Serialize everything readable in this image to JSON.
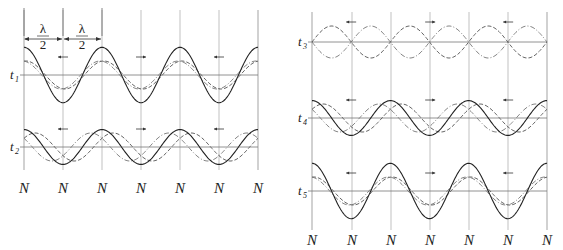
{
  "figure": {
    "wavelength_label": {
      "numerator": "λ",
      "denominator": "2"
    },
    "node_label": "N",
    "colors": {
      "line": "#333333",
      "grid": "#999999",
      "resultant": "#222222",
      "components": "#666666"
    }
  },
  "left_panel": {
    "node_x": [
      24,
      63,
      102,
      141,
      180,
      219,
      258
    ],
    "node_labels": [
      "N",
      "N",
      "N",
      "N",
      "N",
      "N",
      "N"
    ],
    "rows": [
      {
        "time_label": "t",
        "subscript": "1",
        "baseline_y": 75,
        "component_amp": 14,
        "phase": 0.15,
        "resultant_amp": 28
      },
      {
        "time_label": "t",
        "subscript": "2",
        "baseline_y": 147,
        "component_amp": 14,
        "phase": 0.9,
        "resultant_amp": 9
      }
    ],
    "dimension": {
      "label_1": "λ",
      "label_1_den": "2",
      "label_2": "λ",
      "label_2_den": "2"
    }
  },
  "right_panel": {
    "node_x": [
      312,
      352,
      391,
      430,
      469,
      508,
      547
    ],
    "node_labels": [
      "N",
      "N",
      "N",
      "N",
      "N",
      "N",
      "N"
    ],
    "rows": [
      {
        "time_label": "t",
        "subscript": "3",
        "baseline_y": 42,
        "component_amp": 16,
        "phase": 1.5708,
        "resultant_amp": 0
      },
      {
        "time_label": "t",
        "subscript": "4",
        "baseline_y": 118,
        "component_amp": 14,
        "phase": 0.9,
        "resultant_amp": 10
      },
      {
        "time_label": "t",
        "subscript": "5",
        "baseline_y": 191,
        "component_amp": 14,
        "phase": 0.15,
        "resultant_amp": 28
      }
    ]
  }
}
